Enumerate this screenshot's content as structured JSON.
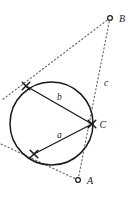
{
  "figure": {
    "name": "circle-tangent-secant-diagram",
    "background_color": "#ffffff",
    "stroke_color": "#1a1a1a",
    "dotted_color": "#6b6b6b",
    "width": 133,
    "height": 198
  },
  "circle": {
    "cx": 51.5,
    "cy": 123.5,
    "r": 41.5,
    "stroke": "#1a1a1a",
    "stroke_width": 1.5,
    "fill": "none"
  },
  "points": {
    "A": {
      "label": "A",
      "marker": "open-circle",
      "x": 78,
      "y": 180,
      "label_x": 87,
      "label_y": 184
    },
    "B": {
      "label": "B",
      "marker": "open-circle",
      "x": 110,
      "y": 18,
      "label_x": 119,
      "label_y": 22
    },
    "C": {
      "label": "C",
      "marker": "cross",
      "x": 92,
      "y": 124,
      "label_x": 99.5,
      "label_y": 128
    },
    "P_upper": {
      "label": "",
      "marker": "cross",
      "x": 26,
      "y": 86
    },
    "P_lower": {
      "label": "",
      "marker": "cross",
      "x": 34,
      "y": 154
    }
  },
  "chords": [
    {
      "id": "chord-b",
      "label": "b",
      "x1": 26,
      "y1": 86,
      "x2": 92,
      "y2": 124,
      "label_x": 57,
      "label_y": 100,
      "stroke": "#1a1a1a",
      "stroke_width": 1.3
    },
    {
      "id": "chord-a",
      "label": "a",
      "x1": 34,
      "y1": 154,
      "x2": 92,
      "y2": 124,
      "label_x": 57,
      "label_y": 138,
      "stroke": "#1a1a1a",
      "stroke_width": 1.3
    }
  ],
  "dotted_lines": [
    {
      "id": "line-BC-A",
      "label": "c",
      "x1": 110,
      "y1": 18,
      "x2": 78,
      "y2": 180,
      "label_x": 104,
      "label_y": 86,
      "stroke": "#6b6b6b",
      "stroke_width": 1.2,
      "dash": "1.2 2.6"
    },
    {
      "id": "line-B-through-upper",
      "label": "",
      "x1": 110,
      "y1": 18,
      "x2": 2,
      "y2": 100,
      "stroke": "#6b6b6b",
      "stroke_width": 1.2,
      "dash": "1.2 2.6"
    },
    {
      "id": "line-A-through-lower",
      "label": "",
      "x1": 78,
      "y1": 180,
      "x2": 1,
      "y2": 144,
      "stroke": "#6b6b6b",
      "stroke_width": 1.2,
      "dash": "1.2 2.6"
    }
  ],
  "labels": {
    "a": "a",
    "b": "b",
    "c": "c",
    "A": "A",
    "B": "B",
    "C": "C"
  }
}
